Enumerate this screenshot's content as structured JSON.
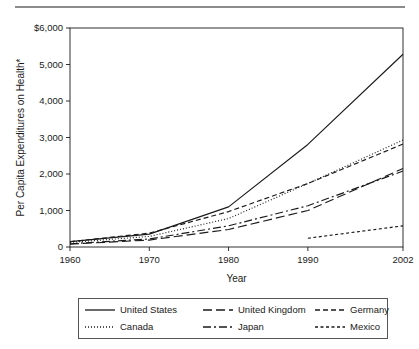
{
  "figure": {
    "top_rule": "horizontal-rule",
    "background_color": "#ffffff",
    "line_color": "#1a1a1a"
  },
  "chart_data": {
    "type": "line",
    "title": "",
    "xlabel": "Year",
    "ylabel": "Per Capita Expenditures on Health*",
    "xlim": [
      1960,
      2002
    ],
    "ylim": [
      0,
      6000
    ],
    "ytick_labels": [
      "$6,000",
      "5,000",
      "4,000",
      "3,000",
      "2,000",
      "1,000",
      "0"
    ],
    "ytick_values": [
      6000,
      5000,
      4000,
      3000,
      2000,
      1000,
      0
    ],
    "xtick_labels": [
      "1960",
      "1970",
      "1980",
      "1990",
      "2002"
    ],
    "xtick_values": [
      1960,
      1970,
      1980,
      1990,
      2002
    ],
    "grid": false,
    "legend_position": "below-plot",
    "x": [
      1960,
      1970,
      1980,
      1990,
      2002
    ],
    "series": [
      {
        "name": "United States",
        "style": "solid",
        "values": [
          148,
          352,
          1100,
          2810,
          5280
        ]
      },
      {
        "name": "Canada",
        "style": "dotted",
        "values": [
          125,
          290,
          780,
          1740,
          2930
        ]
      },
      {
        "name": "United Kingdom",
        "style": "long-dash",
        "values": [
          80,
          190,
          480,
          1000,
          2150
        ]
      },
      {
        "name": "Japan",
        "style": "dash-dot",
        "values": [
          90,
          220,
          580,
          1130,
          2080
        ]
      },
      {
        "name": "Germany",
        "style": "medium-dash",
        "values": [
          145,
          380,
          970,
          1740,
          2820
        ]
      },
      {
        "name": "Mexico",
        "style": "short-dash",
        "values": [
          null,
          null,
          null,
          240,
          580
        ]
      }
    ]
  },
  "legend": {
    "entries": [
      {
        "label": "United States",
        "style": "solid"
      },
      {
        "label": "United Kingdom",
        "style": "long-dash"
      },
      {
        "label": "Germany",
        "style": "medium-dash"
      },
      {
        "label": "Canada",
        "style": "dotted"
      },
      {
        "label": "Japan",
        "style": "dash-dot"
      },
      {
        "label": "Mexico",
        "style": "short-dash"
      }
    ]
  }
}
